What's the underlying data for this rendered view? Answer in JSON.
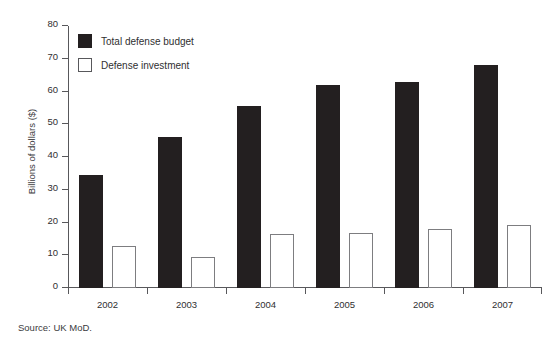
{
  "chart_data": {
    "type": "bar",
    "title": "",
    "xlabel": "",
    "ylabel": "Billions of dollars ($)",
    "ylim": [
      0,
      80
    ],
    "yticks": [
      0,
      10,
      20,
      30,
      40,
      50,
      60,
      70,
      80
    ],
    "grid": false,
    "legend_position": "upper-left-inside",
    "categories": [
      "2002",
      "2003",
      "2004",
      "2005",
      "2006",
      "2007"
    ],
    "series": [
      {
        "name": "Total defense budget",
        "color": "#231f20",
        "style": "filled",
        "values": [
          34.5,
          46,
          55.5,
          62,
          63,
          68
        ]
      },
      {
        "name": "Defense investment",
        "color": "#ffffff",
        "style": "hollow",
        "values": [
          12.8,
          9.5,
          16.6,
          16.9,
          17.9,
          19.1
        ]
      }
    ],
    "notes": "Source: UK MoD."
  },
  "figure": {
    "cut_off_title": "",
    "source_note": "Source: UK MoD."
  },
  "axis": {
    "y_title": "Billions of dollars ($)",
    "tick_labels_y": [
      "80",
      "70",
      "60",
      "50",
      "40",
      "30",
      "20",
      "10",
      "0"
    ],
    "tick_labels_x": [
      "2002",
      "2003",
      "2004",
      "2005",
      "2006",
      "2007"
    ]
  },
  "legend": {
    "items": [
      {
        "label": "Total defense budget"
      },
      {
        "label": "Defense investment"
      }
    ]
  }
}
